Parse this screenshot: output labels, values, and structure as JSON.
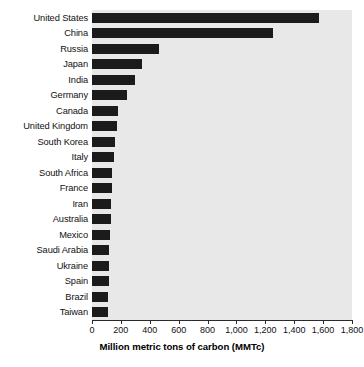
{
  "chart_data": {
    "type": "bar",
    "orientation": "horizontal",
    "title": "",
    "xlabel": "Million metric tons of carbon (MMTc)",
    "ylabel": "",
    "xlim": [
      0,
      1800
    ],
    "ylim": null,
    "grid": false,
    "legend": null,
    "bar_color": "#1b1b1b",
    "plot_background": "#e8e8e8",
    "xticks": [
      0,
      200,
      400,
      600,
      800,
      1000,
      1200,
      1400,
      1600,
      1800
    ],
    "xtick_labels": [
      "0",
      "200",
      "400",
      "600",
      "800",
      "1,000",
      "1,200",
      "1,400",
      "1,600",
      "1,800"
    ],
    "categories": [
      "United States",
      "China",
      "Russia",
      "Japan",
      "India",
      "Germany",
      "Canada",
      "United Kingdom",
      "South Korea",
      "Italy",
      "South Africa",
      "France",
      "Iran",
      "Australia",
      "Mexico",
      "Saudi Arabia",
      "Ukraine",
      "Spain",
      "Brazil",
      "Taiwan"
    ],
    "values": [
      1570,
      1250,
      465,
      345,
      300,
      240,
      180,
      170,
      160,
      155,
      140,
      135,
      130,
      130,
      125,
      120,
      120,
      120,
      112,
      110
    ]
  }
}
